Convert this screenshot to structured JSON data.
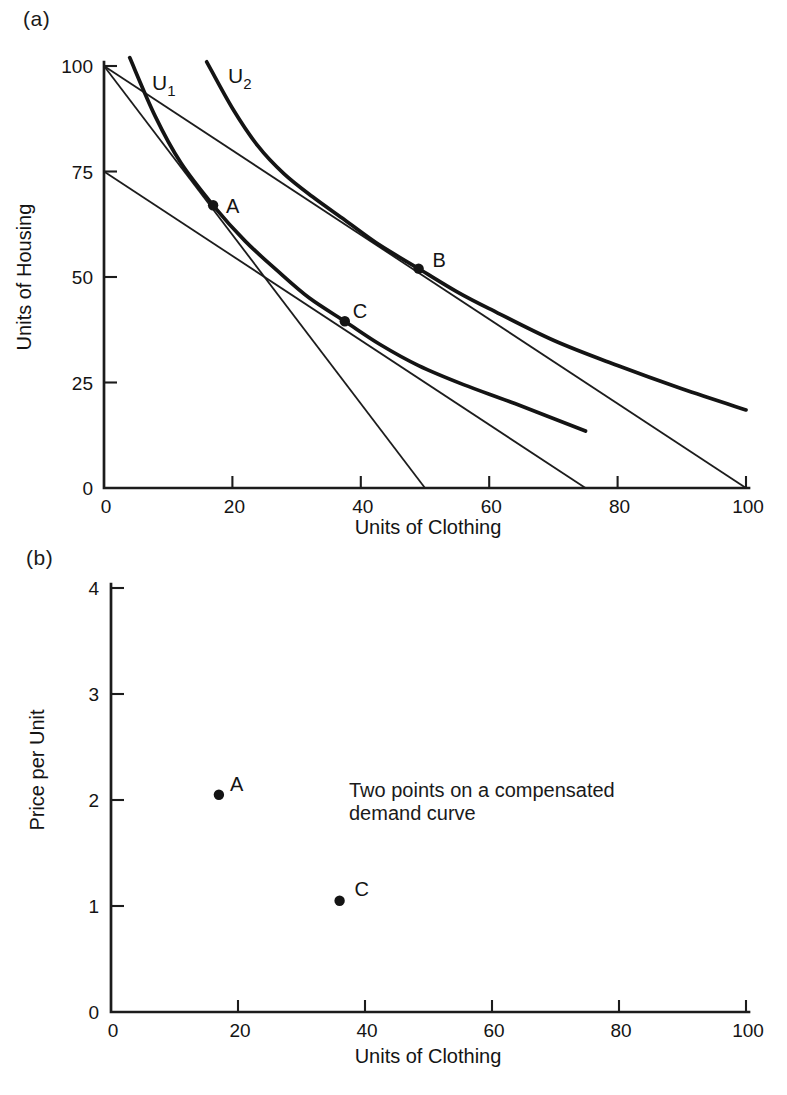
{
  "figure": {
    "panel_a_tag": "(a)",
    "panel_b_tag": "(b)"
  },
  "chart_data": [
    {
      "id": "a",
      "type": "line",
      "title": "",
      "xlabel": "Units of Clothing",
      "ylabel": "Units of Housing",
      "xlim": [
        0,
        100
      ],
      "ylim": [
        0,
        100
      ],
      "xticks": [
        0,
        20,
        40,
        60,
        80,
        100
      ],
      "yticks": [
        0,
        25,
        50,
        75,
        100
      ],
      "grid": false,
      "budget_lines": [
        {
          "name": "initial-budget-line",
          "points": [
            [
              0,
              100
            ],
            [
              50,
              0
            ]
          ]
        },
        {
          "name": "lower-price-budget-line",
          "points": [
            [
              0,
              100
            ],
            [
              100,
              0
            ]
          ]
        },
        {
          "name": "compensated-budget-line",
          "points": [
            [
              0,
              75
            ],
            [
              75,
              0
            ]
          ]
        }
      ],
      "indifference_curves": [
        {
          "name": "U1",
          "label": "U",
          "subscript": "1",
          "points": [
            [
              4,
              102
            ],
            [
              8,
              88
            ],
            [
              12,
              77
            ],
            [
              17,
              67
            ],
            [
              22,
              58.5
            ],
            [
              27,
              51.5
            ],
            [
              32,
              45
            ],
            [
              37.5,
              39.5
            ],
            [
              43,
              34
            ],
            [
              49,
              29
            ],
            [
              56,
              24.5
            ],
            [
              64,
              20
            ],
            [
              75,
              13.5
            ]
          ]
        },
        {
          "name": "U2",
          "label": "U",
          "subscript": "2",
          "points": [
            [
              16,
              101
            ],
            [
              20,
              90
            ],
            [
              24,
              81
            ],
            [
              28,
              74.5
            ],
            [
              32.5,
              69
            ],
            [
              37.5,
              63.5
            ],
            [
              43,
              57.5
            ],
            [
              49,
              52
            ],
            [
              55,
              46.5
            ],
            [
              60,
              42.5
            ],
            [
              70,
              35
            ],
            [
              80,
              29
            ],
            [
              90,
              23.5
            ],
            [
              100,
              18.5
            ]
          ]
        }
      ],
      "points": [
        {
          "label": "A",
          "x": 17,
          "y": 67
        },
        {
          "label": "B",
          "x": 49,
          "y": 52
        },
        {
          "label": "C",
          "x": 37.5,
          "y": 39.5
        }
      ]
    },
    {
      "id": "b",
      "type": "scatter",
      "title": "",
      "xlabel": "Units of Clothing",
      "ylabel": "Price per Unit",
      "xlim": [
        0,
        100
      ],
      "ylim": [
        0,
        4
      ],
      "xticks": [
        0,
        20,
        40,
        60,
        80,
        100
      ],
      "yticks": [
        0,
        1,
        2,
        3,
        4
      ],
      "grid": false,
      "points": [
        {
          "label": "A",
          "x": 17,
          "y": 2.05
        },
        {
          "label": "C",
          "x": 36,
          "y": 1.05
        }
      ],
      "annotation": "Two points on a compensated demand curve"
    }
  ]
}
